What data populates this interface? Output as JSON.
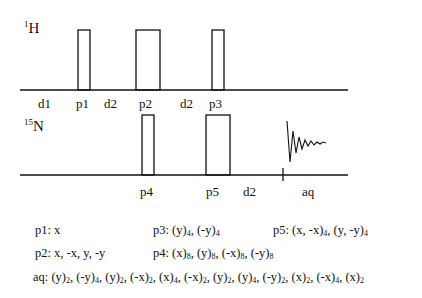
{
  "channels": {
    "h": {
      "mass": "1",
      "symbol": "H"
    },
    "n": {
      "mass": "15",
      "symbol": "N"
    }
  },
  "h_labels": [
    "d1",
    "p1",
    "d2",
    "p2",
    "d2",
    "p3"
  ],
  "n_labels": [
    "p4",
    "p5",
    "d2",
    "aq"
  ],
  "phase_cycles": {
    "p1": {
      "name": "p1:",
      "terms": [
        {
          "t": "x",
          "s": ""
        }
      ]
    },
    "p2": {
      "name": "p2:",
      "terms": [
        {
          "t": "x, -x, y, -y",
          "s": ""
        }
      ]
    },
    "p3": {
      "name": "p3:",
      "terms": [
        {
          "t": "(y)",
          "s": "4"
        },
        {
          "t": ", (-y)",
          "s": "4"
        }
      ]
    },
    "p4": {
      "name": "p4:",
      "terms": [
        {
          "t": "(x)",
          "s": "8"
        },
        {
          "t": ", (y)",
          "s": "8"
        },
        {
          "t": ", (-x)",
          "s": "8"
        },
        {
          "t": ", (-y)",
          "s": "8"
        }
      ]
    },
    "p5": {
      "name": "p5:",
      "terms": [
        {
          "t": "(x, -x)",
          "s": "4"
        },
        {
          "t": ", (y, -y)",
          "s": "4"
        }
      ]
    },
    "aq": {
      "name": "aq:",
      "terms": [
        {
          "t": "(y)",
          "s": "2"
        },
        {
          "t": ", (-y)",
          "s": "4"
        },
        {
          "t": ", (y)",
          "s": "2"
        },
        {
          "t": ", (-x)",
          "s": "2"
        },
        {
          "t": ", (x)",
          "s": "4"
        },
        {
          "t": ", (-x)",
          "s": "2"
        },
        {
          "t": ", (y)",
          "s": "2"
        },
        {
          "t": ", (y)",
          "s": "4"
        },
        {
          "t": ", (-y)",
          "s": "2"
        },
        {
          "t": ", (x)",
          "s": "2"
        },
        {
          "t": ", (-x)",
          "s": "4"
        },
        {
          "t": ", (x)",
          "s": "2"
        }
      ]
    }
  }
}
